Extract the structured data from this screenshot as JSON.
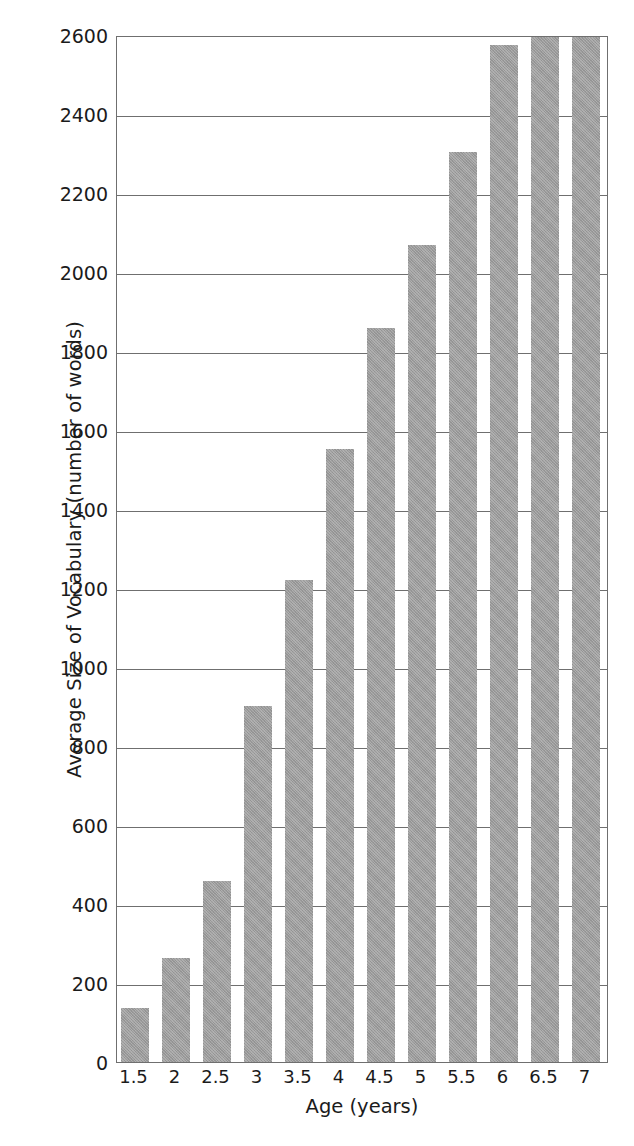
{
  "chart_data": {
    "type": "bar",
    "title": "",
    "xlabel": "Age (years)",
    "ylabel": "Average Size of Vocabulary (number of words)",
    "categories": [
      "1.5",
      "2",
      "2.5",
      "3",
      "3.5",
      "4",
      "4.5",
      "5",
      "5.5",
      "6",
      "6.5",
      "7"
    ],
    "values": [
      137,
      263,
      458,
      902,
      1221,
      1553,
      1858,
      2068,
      2305,
      2575,
      2610,
      2610
    ],
    "ylim": [
      0,
      2600
    ],
    "xlim_note": "categorical",
    "ytick_labels": [
      "0",
      "200",
      "400",
      "600",
      "800",
      "1000",
      "1200",
      "1400",
      "1600",
      "1800",
      "2000",
      "2200",
      "2400",
      "2600"
    ],
    "ytick_values": [
      0,
      200,
      400,
      600,
      800,
      1000,
      1200,
      1400,
      1600,
      1800,
      2000,
      2200,
      2400,
      2600
    ],
    "grid": true,
    "grid_axis": "y",
    "legend": null,
    "legend_position": "none",
    "bar_color": "#9b9b9b",
    "axis_color": "#6f6f6f",
    "text_color": "#1b1b1b"
  },
  "axes": {
    "y_title": "Average Size of Vocabulary (number of words)",
    "x_title": "Age (years)"
  }
}
